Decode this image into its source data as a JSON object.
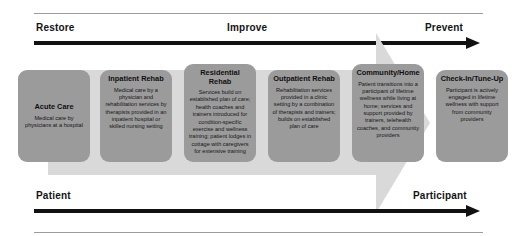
{
  "diagram": {
    "title_axes": {
      "top": {
        "left_label": "Restore",
        "middle_label": "Improve",
        "right_label": "Prevent"
      },
      "bottom": {
        "left_label": "Patient",
        "right_label": "Participant"
      }
    },
    "colors": {
      "stage_box": "#9b9b9b",
      "background_arrow": "#d9d9d9",
      "axis_arrow": "#111111",
      "hairline": "#9c9c9c",
      "text": "#101010"
    },
    "stages": [
      {
        "title": "Acute Care",
        "description": "Medical care by physicians at a hospital"
      },
      {
        "title": "Inpatient Rehab",
        "description": "Medical care by a physician and rehabilitation services by therapists provided in an inpatient hospital or skilled nursing setting"
      },
      {
        "title": "Residential Rehab",
        "description": "Services build on established plan of care; health coaches and trainers introduced for condition-specific exercise and wellness training; patient lodges in cottage with caregivers for extensive training"
      },
      {
        "title": "Outpatient Rehab",
        "description": "Rehabilitation services provided in a clinic setting by a combination of therapists and trainers; builds on established plan of care"
      },
      {
        "title": "Community/Home",
        "description": "Patient transitions into a participant of lifetime wellness while living at home; services and support provided by trainers, telehealth coaches, and community providers"
      },
      {
        "title": "Check-In/Tune-Up",
        "description": "Participant is actively engaged in lifetime wellness with support from community providers"
      }
    ]
  }
}
